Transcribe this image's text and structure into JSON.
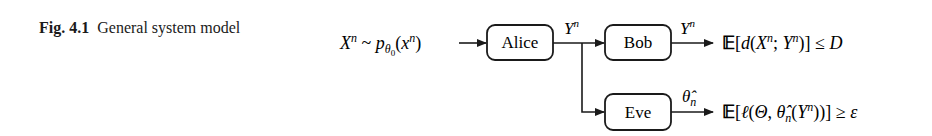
{
  "caption": {
    "label": "Fig. 4.1",
    "text": "General system model"
  },
  "diagram": {
    "input": "Xⁿ ~ pθ₀(xⁿ)",
    "nodes": [
      {
        "id": "alice",
        "label": "Alice"
      },
      {
        "id": "bob",
        "label": "Bob"
      },
      {
        "id": "eve",
        "label": "Eve"
      }
    ],
    "edges": [
      {
        "from": "input",
        "to": "alice",
        "label": ""
      },
      {
        "from": "alice",
        "to": "bob",
        "label": "Yⁿ"
      },
      {
        "from": "alice",
        "to": "eve",
        "label": ""
      },
      {
        "from": "bob",
        "to": "out_bob",
        "label": "Yⁿ"
      },
      {
        "from": "eve",
        "to": "out_eve",
        "label": "θ̂ₙ"
      }
    ],
    "outputs": {
      "bob": "𝔼[d(Xⁿ, Yⁿ)] ≤ D",
      "eve": "𝔼[ℓ(Θ, θ̂ₙ(Yⁿ))] ≥ ε"
    },
    "colors": {
      "stroke": "#1a1a1a",
      "background": "#ffffff"
    }
  }
}
